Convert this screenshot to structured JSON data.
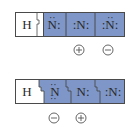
{
  "colors": {
    "shade": "#7f97c8",
    "border": "#4a4a4a",
    "hydrogen_bg": "#ffffff"
  },
  "structures": [
    {
      "atoms": [
        "H",
        ":N̈:",
        ":N:",
        ":N̈:"
      ],
      "labels": {
        "h": "H",
        "n1": "N",
        "n2": "N",
        "n3": "N"
      },
      "charges": [
        {
          "atom_index": 2,
          "sign": "+"
        },
        {
          "atom_index": 3,
          "sign": "−"
        }
      ]
    },
    {
      "atoms": [
        "H",
        "N̈",
        "N:",
        ":N:"
      ],
      "labels": {
        "h": "H",
        "n1": "N",
        "n2": "N",
        "n3": "N"
      },
      "charges": [
        {
          "atom_index": 1,
          "sign": "−"
        },
        {
          "atom_index": 2,
          "sign": "+"
        }
      ]
    }
  ]
}
